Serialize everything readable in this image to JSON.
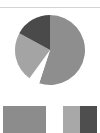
{
  "chart_data": {
    "type": "pie",
    "title": "",
    "slices": [
      {
        "label": "",
        "value": 55,
        "color": "#8e8e8e"
      },
      {
        "label": "",
        "value": 5,
        "color": "#ffffff"
      },
      {
        "label": "",
        "value": 23,
        "color": "#a4a4a4"
      },
      {
        "label": "",
        "value": 17,
        "color": "#4a4a4a"
      }
    ],
    "start_angle_deg": 0,
    "direction": "clockwise",
    "legend": {
      "position": "bottom",
      "entries": [
        {
          "label": "",
          "color": "#8c8c8c"
        },
        {
          "label": "",
          "colors": [
            "#a8a8a8",
            "#4e4e4e"
          ]
        }
      ]
    }
  },
  "colors": {
    "background": "#ffffff",
    "rule": "#d4d4d4"
  }
}
